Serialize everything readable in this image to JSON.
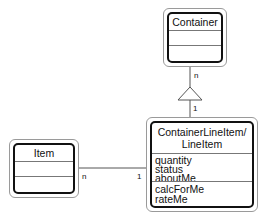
{
  "diagram": {
    "type": "uml-class-diagram",
    "classes": [
      {
        "id": "container",
        "name": "Container",
        "attributes": [],
        "operations": []
      },
      {
        "id": "container_line_item",
        "name_line1": "ContainerLineItem/",
        "name_line2": "LineItem",
        "attributes": [
          "quantity",
          "status",
          "aboutMe"
        ],
        "operations": [
          "calcForMe",
          "rateMe"
        ]
      },
      {
        "id": "item",
        "name": "Item",
        "attributes": [],
        "operations": []
      }
    ],
    "relationships": [
      {
        "from": "Container",
        "to": "ContainerLineItem/LineItem",
        "kind": "aggregation-triangle",
        "mult_container_end": "n",
        "mult_lineitem_end": "1"
      },
      {
        "from": "Item",
        "to": "ContainerLineItem/LineItem",
        "kind": "association",
        "mult_item_end": "n",
        "mult_lineitem_end": "1"
      }
    ]
  }
}
